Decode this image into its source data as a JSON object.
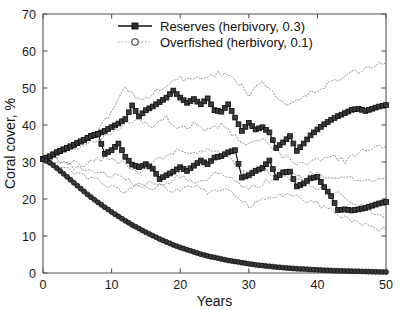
{
  "chart_data": {
    "type": "line",
    "title": "",
    "subtitle": "",
    "xlabel": "Years",
    "ylabel": "Coral cover, %",
    "xlim": [
      0,
      50
    ],
    "ylim": [
      0,
      70
    ],
    "xticks": [
      0,
      10,
      20,
      30,
      40,
      50
    ],
    "yticks": [
      0,
      10,
      20,
      30,
      40,
      50,
      60,
      70
    ],
    "xtick_labels": [
      "0",
      "10",
      "20",
      "30",
      "40",
      "50"
    ],
    "ytick_labels": [
      "0",
      "10",
      "20",
      "30",
      "40",
      "50",
      "60",
      "70"
    ],
    "grid": false,
    "legend_position": "top-center",
    "legend": [
      {
        "label": "Reserves (herbivory, 0.3)",
        "marker": "square",
        "linestyle": "solid",
        "color": "#141414"
      },
      {
        "label": "Overfished (herbivory, 0.1)",
        "marker": "circle",
        "linestyle": "dotted",
        "color": "#8a8a8a"
      }
    ],
    "series": [
      {
        "name": "Reserves (herbivory, 0.3) - upper highlighted run",
        "group": "Reserves (herbivory, 0.3)",
        "marker": "square",
        "linestyle": "solid",
        "x": [
          0,
          1,
          2,
          3,
          4,
          5,
          6,
          7,
          8,
          9,
          10,
          11,
          12,
          13,
          14,
          15,
          16,
          17,
          18,
          19,
          20,
          21,
          22,
          23,
          24,
          25,
          26,
          27,
          28,
          29,
          30,
          31,
          32,
          33,
          34,
          35,
          36,
          37,
          38,
          39,
          40,
          41,
          42,
          43,
          44,
          45,
          46,
          47,
          48,
          49,
          50
        ],
        "values": [
          30.8,
          31.5,
          32.6,
          33.4,
          34.2,
          35.1,
          36.0,
          37.0,
          37.6,
          38.4,
          39.4,
          40.4,
          41.6,
          45.3,
          42.3,
          44.0,
          45.0,
          46.2,
          47.4,
          49.3,
          47.4,
          46.0,
          47.0,
          45.6,
          47.2,
          44.0,
          43.6,
          45.6,
          42.0,
          38.4,
          40.6,
          38.8,
          39.4,
          38.0,
          33.8,
          35.3,
          37.0,
          33.0,
          35.0,
          37.2,
          38.8,
          40.2,
          41.4,
          42.4,
          43.2,
          44.1,
          44.4,
          43.8,
          44.4,
          45.0,
          45.4
        ]
      },
      {
        "name": "Reserves (herbivory, 0.3) - lower highlighted run",
        "group": "Reserves (herbivory, 0.3)",
        "marker": "square",
        "linestyle": "solid",
        "x": [
          0,
          1,
          2,
          3,
          4,
          5,
          6,
          7,
          8,
          9,
          10,
          11,
          12,
          13,
          14,
          15,
          16,
          17,
          18,
          19,
          20,
          21,
          22,
          23,
          24,
          25,
          26,
          27,
          28,
          29,
          30,
          31,
          32,
          33,
          34,
          35,
          36,
          37,
          38,
          39,
          40,
          41,
          42,
          43,
          44,
          45,
          46,
          47,
          48,
          49,
          50
        ],
        "values": [
          30.8,
          31.5,
          32.6,
          33.4,
          34.2,
          35.1,
          36.0,
          37.0,
          37.6,
          32.2,
          33.2,
          35.0,
          31.4,
          29.3,
          28.6,
          29.4,
          28.2,
          25.4,
          26.4,
          27.4,
          28.6,
          27.6,
          29.0,
          30.4,
          29.4,
          31.2,
          31.6,
          32.6,
          33.2,
          25.8,
          26.4,
          27.6,
          28.4,
          30.4,
          25.8,
          27.2,
          27.4,
          23.4,
          24.2,
          25.6,
          26.0,
          23.2,
          20.8,
          17.0,
          17.2,
          16.9,
          17.2,
          17.6,
          18.2,
          18.8,
          19.2
        ]
      },
      {
        "name": "Overfished (herbivory, 0.1) - highlighted run",
        "group": "Overfished (herbivory, 0.1)",
        "marker": "circle",
        "linestyle": "solid",
        "x": [
          0,
          1,
          2,
          3,
          4,
          5,
          6,
          7,
          8,
          9,
          10,
          11,
          12,
          13,
          14,
          15,
          16,
          17,
          18,
          19,
          20,
          21,
          22,
          23,
          24,
          25,
          26,
          27,
          28,
          29,
          30,
          31,
          32,
          33,
          34,
          35,
          36,
          37,
          38,
          39,
          40,
          41,
          42,
          43,
          44,
          45,
          46,
          47,
          48,
          49,
          50
        ],
        "values": [
          30.8,
          29.8,
          28.4,
          26.8,
          25.2,
          23.6,
          22.0,
          20.5,
          19.1,
          17.8,
          16.5,
          15.3,
          14.1,
          13.0,
          12.0,
          11.0,
          10.1,
          9.2,
          8.4,
          7.6,
          6.9,
          6.3,
          5.7,
          5.1,
          4.6,
          4.2,
          3.8,
          3.4,
          3.1,
          2.8,
          2.5,
          2.2,
          2.0,
          1.8,
          1.6,
          1.45,
          1.3,
          1.15,
          1.05,
          0.95,
          0.85,
          0.75,
          0.68,
          0.6,
          0.55,
          0.5,
          0.45,
          0.4,
          0.35,
          0.3,
          0.28
        ]
      }
    ],
    "replicates": [
      {
        "name": "Overfished replicate A",
        "group": "Overfished (herbivory, 0.1)",
        "linestyle": "dotted",
        "x": [
          0,
          2,
          4,
          6,
          8,
          10,
          12,
          14,
          16,
          18,
          20,
          22,
          24,
          26,
          28,
          30,
          32,
          34,
          36,
          38,
          40,
          42,
          44,
          46,
          48,
          50
        ],
        "values": [
          30.8,
          32.5,
          34.0,
          36.0,
          38.5,
          43.5,
          50.3,
          47.0,
          48.5,
          51.0,
          52.5,
          52.0,
          53.0,
          54.0,
          52.0,
          48.5,
          52.0,
          48.0,
          45.5,
          47.5,
          49.5,
          51.5,
          53.0,
          54.5,
          55.5,
          56.8
        ]
      },
      {
        "name": "Overfished replicate B",
        "group": "Overfished (herbivory, 0.1)",
        "linestyle": "dotted",
        "x": [
          0,
          2,
          4,
          6,
          8,
          10,
          12,
          14,
          16,
          18,
          20,
          22,
          24,
          26,
          28,
          30,
          32,
          34,
          36,
          38,
          40,
          42,
          44,
          46,
          48,
          50
        ],
        "values": [
          30.8,
          31.6,
          33.0,
          34.5,
          36.0,
          38.0,
          40.5,
          41.5,
          40.0,
          42.0,
          39.0,
          40.5,
          38.5,
          40.0,
          37.0,
          34.5,
          36.0,
          33.0,
          30.5,
          29.0,
          30.5,
          32.0,
          30.0,
          32.5,
          33.5,
          34.2
        ]
      },
      {
        "name": "Overfished replicate C",
        "group": "Overfished (herbivory, 0.1)",
        "linestyle": "dotted",
        "x": [
          0,
          2,
          4,
          6,
          8,
          10,
          12,
          14,
          16,
          18,
          20,
          22,
          24,
          26,
          28,
          30,
          32,
          34,
          36,
          38,
          40,
          42,
          44,
          46,
          48,
          50
        ],
        "values": [
          30.8,
          30.5,
          30.0,
          29.5,
          30.5,
          31.5,
          29.0,
          27.5,
          30.0,
          31.5,
          33.5,
          32.0,
          34.0,
          32.0,
          29.5,
          27.0,
          28.5,
          26.5,
          25.0,
          26.0,
          27.5,
          25.5,
          26.5,
          25.0,
          25.5,
          26.0
        ]
      },
      {
        "name": "Overfished replicate D",
        "group": "Overfished (herbivory, 0.1)",
        "linestyle": "dotted",
        "x": [
          0,
          2,
          4,
          6,
          8,
          10,
          12,
          14,
          16,
          18,
          20,
          22,
          24,
          26,
          28,
          30,
          32,
          34,
          36,
          38,
          40,
          42,
          44,
          46,
          48,
          50
        ],
        "values": [
          30.8,
          30.0,
          28.8,
          28.0,
          27.0,
          26.5,
          25.0,
          23.5,
          24.5,
          23.0,
          22.0,
          23.5,
          22.0,
          23.0,
          21.0,
          18.0,
          19.5,
          20.5,
          21.5,
          20.0,
          18.5,
          17.0,
          15.0,
          13.5,
          12.0,
          12.2
        ]
      },
      {
        "name": "Overfished replicate E",
        "group": "Overfished (herbivory, 0.1)",
        "linestyle": "dotted",
        "x": [
          0,
          2,
          4,
          6,
          8,
          10,
          12,
          14,
          16,
          18,
          20,
          22,
          24,
          26,
          28,
          30,
          32,
          34,
          36,
          38,
          40,
          42,
          44,
          46,
          48,
          50
        ],
        "values": [
          30.8,
          29.0,
          27.5,
          26.0,
          25.0,
          23.0,
          21.5,
          24.0,
          22.5,
          24.5,
          26.0,
          24.0,
          25.5,
          27.5,
          25.0,
          22.5,
          24.0,
          26.0,
          27.5,
          25.0,
          23.0,
          22.0,
          20.5,
          18.5,
          16.5,
          15.0
        ]
      }
    ],
    "annotations": []
  },
  "axes": {
    "xlabel": "Years",
    "ylabel": "Coral cover, %"
  }
}
